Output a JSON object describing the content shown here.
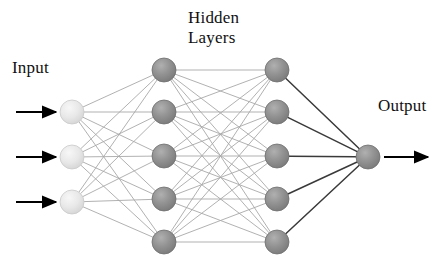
{
  "diagram": {
    "type": "neural-network",
    "title_labels": {
      "input": "Input",
      "hidden_line1": "Hidden",
      "hidden_line2": "Layers",
      "output": "Output"
    },
    "colors": {
      "background": "#ffffff",
      "input_node_fill": "#e3e3e3",
      "input_node_highlight": "#f4f4f4",
      "input_node_edge": "#c9c9c9",
      "hidden_node_fill": "#8e8e8e",
      "hidden_node_highlight": "#aaaaaa",
      "hidden_node_edge": "#6f6f6f",
      "output_node_fill": "#8e8e8e",
      "output_node_highlight": "#aaaaaa",
      "output_node_edge": "#6f6f6f",
      "connection_light": "#a8a8a8",
      "connection_dark": "#3a3a3a",
      "arrow": "#000000",
      "text": "#111111"
    },
    "layers": [
      {
        "id": "input",
        "name": "Input",
        "node_count": 3,
        "x": 72,
        "radius": 12,
        "node_style": "light",
        "nodes_y": [
          112,
          157,
          202
        ]
      },
      {
        "id": "hidden1",
        "name": "Hidden Layer 1",
        "node_count": 5,
        "x": 164,
        "radius": 12,
        "node_style": "dark",
        "nodes_y": [
          70,
          112,
          156,
          199,
          242
        ]
      },
      {
        "id": "hidden2",
        "name": "Hidden Layer 2",
        "node_count": 5,
        "x": 277,
        "radius": 12,
        "node_style": "dark",
        "nodes_y": [
          70,
          112,
          156,
          199,
          242
        ]
      },
      {
        "id": "output",
        "name": "Output",
        "node_count": 1,
        "x": 368,
        "radius": 12,
        "node_style": "dark",
        "nodes_y": [
          157
        ]
      }
    ],
    "input_arrows": [
      {
        "x1": 16,
        "y1": 112,
        "x2": 56,
        "y2": 112
      },
      {
        "x1": 16,
        "y1": 157,
        "x2": 56,
        "y2": 157
      },
      {
        "x1": 16,
        "y1": 202,
        "x2": 56,
        "y2": 202
      }
    ],
    "output_arrows": [
      {
        "x1": 384,
        "y1": 157,
        "x2": 428,
        "y2": 157
      }
    ],
    "connection_groups": [
      {
        "from": "input",
        "to": "hidden1",
        "style": "light",
        "fully_connected": true
      },
      {
        "from": "hidden1",
        "to": "hidden2",
        "style": "light",
        "fully_connected": true
      },
      {
        "from": "hidden2",
        "to": "output",
        "style": "dark",
        "fully_connected": true
      }
    ]
  }
}
